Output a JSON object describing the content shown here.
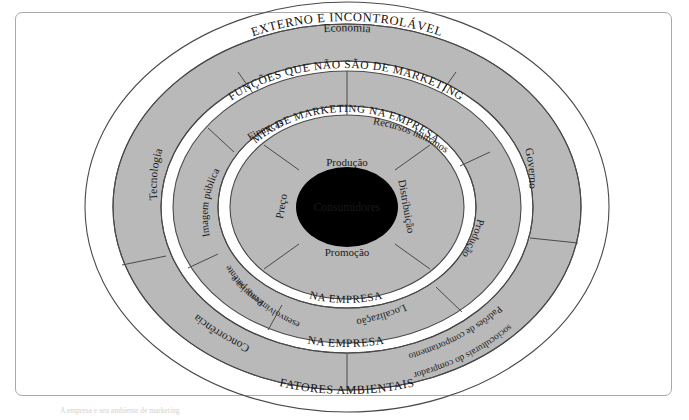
{
  "figure": {
    "type": "concentric-ring-diagram",
    "center_label": "Consumidores",
    "caption_partial": "A empresa e seu ambiente de marketing",
    "colors": {
      "ring_fill": "#b9b9b9",
      "band_fill": "#ffffff",
      "core_fill": "#000000",
      "core_text": "#ffffff",
      "stroke": "#4a4a4a",
      "frame": "#a9a9a9"
    }
  },
  "rings": [
    {
      "index": 1,
      "name": "mix-de-marketing",
      "band_label_top": "MIX DE MARKETING NA EMPRESA",
      "band_label_bottom": "NA EMPRESA",
      "segments": [
        {
          "label": "Produção",
          "position": "top"
        },
        {
          "label": "Distribuição",
          "position": "right"
        },
        {
          "label": "Promoção",
          "position": "bottom"
        },
        {
          "label": "Preço",
          "position": "left"
        }
      ]
    },
    {
      "index": 2,
      "name": "funcoes-que-nao-sao-de-marketing",
      "band_label_top": "FUNÇÕES QUE NÃO SÃO DE MARKETING",
      "band_label_bottom": "NA EMPRESA",
      "segments": [
        {
          "label": "Recursos humanos"
        },
        {
          "label": "Produção"
        },
        {
          "label": "Localização"
        },
        {
          "label": "Pesquisa e desenvolvimento; patentes"
        },
        {
          "label": "Imagem pública"
        },
        {
          "label": "Finanças"
        }
      ]
    },
    {
      "index": 3,
      "name": "externo-e-incontrolavel",
      "band_label_top": "EXTERNO E INCONTROLÁVEL",
      "band_label_bottom": "FATORES AMBIENTAIS",
      "segments": [
        {
          "label": "Economia"
        },
        {
          "label": "Governo"
        },
        {
          "label": "Padrões de comportamento socioculturais do comprador"
        },
        {
          "label": "Concorrência"
        },
        {
          "label": "Tecnologia"
        }
      ]
    }
  ],
  "text_fragments": {
    "pesquisa_line1": "Pesquisa e",
    "pesquisa_line2": "desenvolvimento; patentes",
    "padroes_line1": "Padrões de comportamento",
    "padroes_line2": "socioculturais do comprador"
  }
}
